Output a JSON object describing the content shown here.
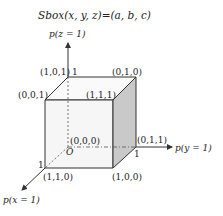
{
  "title": "Sbox(x, y, z)=(a, b, c)",
  "axes": {
    "z": {
      "label": "p(z = 1)",
      "tick": "1"
    },
    "y": {
      "label": "p(y = 1)",
      "tick": "1"
    },
    "x": {
      "label": "p(x = 1)",
      "tick": "1"
    }
  },
  "origin": {
    "label": "O",
    "coord": "(0,0,0)"
  },
  "vertices": {
    "top_back_left": "(1,0,1)",
    "top_back_right": "(0,1,0)",
    "top_front_left": "(0,0,1)",
    "top_front_right": "(1,1,1)",
    "bottom_back_right": "(0,1,1)",
    "bottom_front_left": "(1,1,0)",
    "bottom_front_right": "(1,0,0)"
  },
  "colors": {
    "line": "#333333",
    "front_face": "#f7f7f7",
    "top_face": "#fafafa",
    "side_face": "#c8c8c8"
  }
}
